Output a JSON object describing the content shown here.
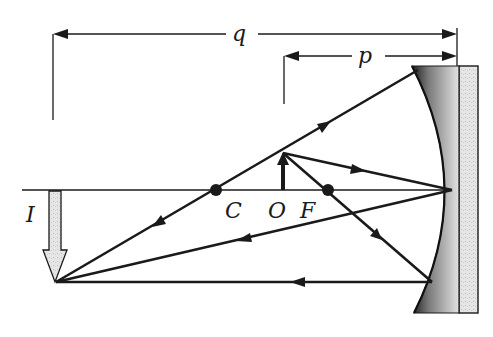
{
  "diagram": {
    "labels": {
      "q": "q",
      "p": "p",
      "image": "I",
      "center": "C",
      "object": "O",
      "focus": "F"
    },
    "dimensions": {
      "q": {
        "label": "q",
        "from_x": 53,
        "to_x": 457,
        "y": 34
      },
      "p": {
        "label": "p",
        "from_x": 284,
        "to_x": 457,
        "y": 56
      }
    },
    "points": {
      "C": {
        "x": 216,
        "y": 190
      },
      "F": {
        "x": 328,
        "y": 190
      },
      "O": {
        "x": 283,
        "y": 190
      },
      "object_tip": {
        "x": 283,
        "y": 153
      },
      "image_tip": {
        "x": 56,
        "y": 282
      }
    },
    "rays": [
      {
        "name": "ray-through-center",
        "from": [
          56,
          282
        ],
        "to": [
          418,
          70
        ],
        "direction": "reflects-back-through-C"
      },
      {
        "name": "ray-to-vertex",
        "from": [
          283,
          153
        ],
        "to": [
          452,
          190
        ],
        "reflected_to": [
          56,
          282
        ]
      },
      {
        "name": "ray-through-focus",
        "from": [
          283,
          153
        ],
        "to": [
          432,
          282
        ],
        "reflected_to": [
          56,
          282
        ]
      }
    ],
    "colors": {
      "ink": "#1a1a1a",
      "mirror_shade_dark": "#2a2a2a",
      "mirror_shade_light": "#d9d9d9",
      "image_fill": "#e4e4e4"
    }
  }
}
